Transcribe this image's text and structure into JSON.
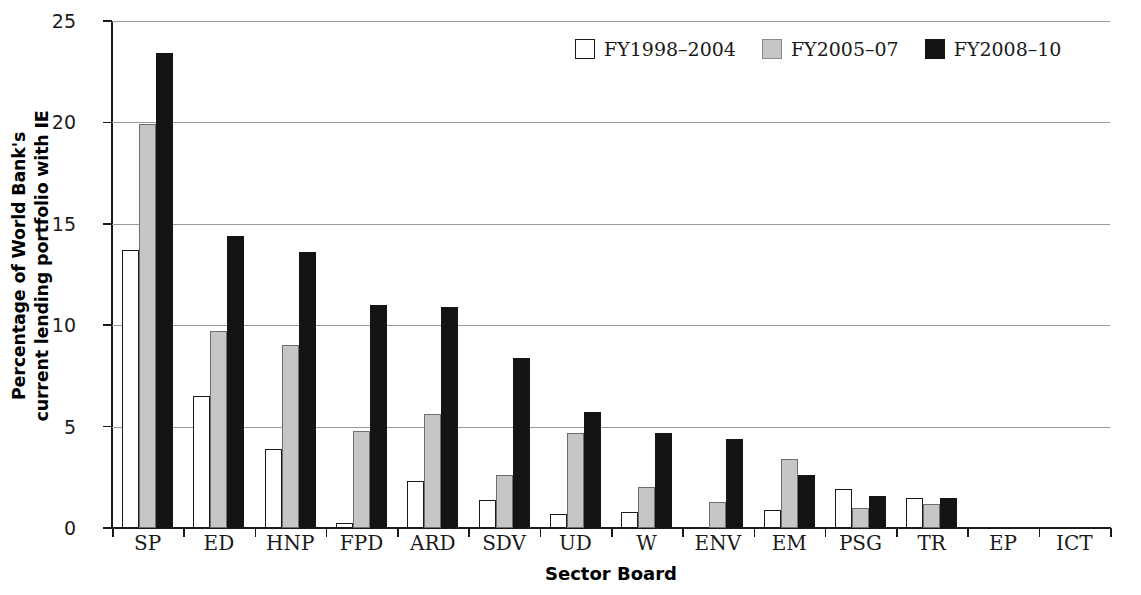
{
  "chart_data": {
    "type": "bar",
    "title": "",
    "xlabel": "Sector Board",
    "ylabel": "Percentage of World Bank's current lending portfolio with IE",
    "ylabel_line1": "Percentage of World Bank's",
    "ylabel_line2": "current lending portfolio with IE",
    "categories": [
      "SP",
      "ED",
      "HNP",
      "FPD",
      "ARD",
      "SDV",
      "UD",
      "W",
      "ENV",
      "EM",
      "PSG",
      "TR",
      "EP",
      "ICT"
    ],
    "series": [
      {
        "name": "FY1998-2004",
        "color": "#ffffff",
        "values": [
          13.7,
          6.5,
          3.9,
          0.25,
          2.3,
          1.4,
          0.7,
          0.8,
          0.0,
          0.9,
          1.9,
          1.5,
          0.0,
          0.0
        ]
      },
      {
        "name": "FY2005-07",
        "color": "#c6c6c6",
        "values": [
          19.9,
          9.7,
          9.0,
          4.8,
          5.6,
          2.6,
          4.7,
          2.0,
          1.3,
          3.4,
          1.0,
          1.2,
          0.0,
          0.0
        ]
      },
      {
        "name": "FY2008-10",
        "color": "#141414",
        "values": [
          23.4,
          14.4,
          13.6,
          11.0,
          10.9,
          8.4,
          5.7,
          4.7,
          4.4,
          2.6,
          1.6,
          1.5,
          0.0,
          0.0
        ]
      }
    ],
    "ylim": [
      0,
      25
    ],
    "yticks": [
      0,
      5,
      10,
      15,
      20,
      25
    ],
    "ytick_labels": [
      "0",
      "5",
      "10",
      "15",
      "20",
      "25"
    ],
    "grid": true,
    "legend_position": "top-right",
    "legend": [
      "FY1998-2004",
      "FY2005-07",
      "FY2008-10"
    ]
  }
}
